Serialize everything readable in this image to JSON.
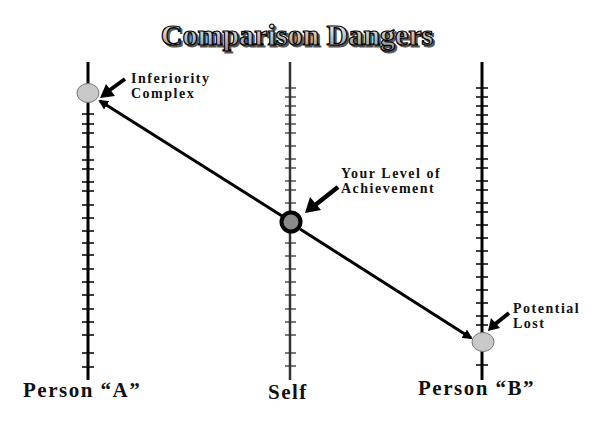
{
  "title": "Comparison Dangers",
  "axes": [
    {
      "id": "person-a",
      "label": "Person “A”",
      "x": 88
    },
    {
      "id": "self",
      "label": "Self",
      "x": 290
    },
    {
      "id": "person-b",
      "label": "Person “B”",
      "x": 482
    }
  ],
  "markers": {
    "person_a": {
      "x": 88,
      "y": 93,
      "fill": "#c8c8c8"
    },
    "self": {
      "x": 291,
      "y": 222,
      "fill": "#8a8a8a",
      "ring": "#000000"
    },
    "person_b": {
      "x": 483,
      "y": 342,
      "fill": "#c8c8c8"
    }
  },
  "callouts": {
    "inferiority": {
      "line1": "Inferiority",
      "line2": "Complex"
    },
    "achievement": {
      "line1": "Your Level of",
      "line2": "Achievement"
    },
    "potential": {
      "line1": "Potential",
      "line2": "Lost"
    }
  },
  "colors": {
    "line": "#000000",
    "marker_gray": "#c8c8c8",
    "self_fill": "#8a8a8a",
    "title_fill": "#d9d9d9"
  }
}
